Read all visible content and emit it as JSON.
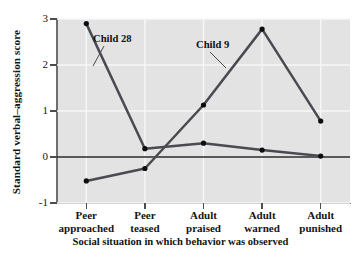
{
  "chart_data": {
    "type": "line",
    "title": "",
    "xlabel": "Social situation in which behavior was observed",
    "ylabel": "Standard verbal–aggression score",
    "categories": [
      "Peer approached",
      "Peer teased",
      "Adult praised",
      "Adult warned",
      "Adult punished"
    ],
    "category_lines": [
      [
        "Peer",
        "approached"
      ],
      [
        "Peer",
        "teased"
      ],
      [
        "Adult",
        "praised"
      ],
      [
        "Adult",
        "warned"
      ],
      [
        "Adult",
        "punished"
      ]
    ],
    "yticks": [
      3,
      2,
      1,
      0,
      -1
    ],
    "ytick_labels": [
      "3",
      "2",
      "1",
      "0",
      "-1"
    ],
    "ylim": [
      -1,
      3
    ],
    "grid": true,
    "legend_position": "inline-annotations",
    "series": [
      {
        "name": "Child 28",
        "values": [
          2.9,
          0.18,
          0.3,
          0.15,
          0.02
        ]
      },
      {
        "name": "Child 9",
        "values": [
          -0.52,
          -0.25,
          1.13,
          2.78,
          0.78
        ]
      }
    ],
    "annotations": [
      {
        "text": "Child 28",
        "target_series": "Child 28"
      },
      {
        "text": "Child 9",
        "target_series": "Child 9"
      }
    ],
    "colors": {
      "panel_background": "#e3e3e3",
      "gridline": "#f7f7f7",
      "line": "#4a4a52",
      "marker": "#0d0d0d",
      "zero_line": "#2b2b2b",
      "axis": "#6e6e6e",
      "text": "#141414"
    }
  }
}
